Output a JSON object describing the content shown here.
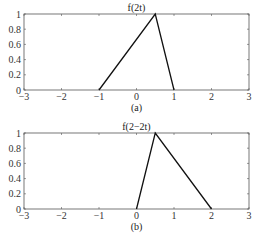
{
  "chart_data": [
    {
      "type": "line",
      "title": "f(2t)",
      "caption": "(a)",
      "xlabel": "",
      "ylabel": "",
      "xlim": [
        -3,
        3
      ],
      "ylim": [
        0,
        1
      ],
      "xticks": [
        "-3",
        "-2",
        "-1",
        "0",
        "1",
        "2",
        "3"
      ],
      "yticks": [
        "0",
        "0.2",
        "0.4",
        "0.6",
        "0.8",
        "1"
      ],
      "grid": false,
      "series": [
        {
          "name": "f(2t)",
          "x": [
            -1,
            0.5,
            1
          ],
          "y": [
            0,
            1,
            0
          ]
        }
      ]
    },
    {
      "type": "line",
      "title": "f(2−2t)",
      "caption": "(b)",
      "xlabel": "",
      "ylabel": "",
      "xlim": [
        -3,
        3
      ],
      "ylim": [
        0,
        1
      ],
      "xticks": [
        "-3",
        "-2",
        "-1",
        "0",
        "1",
        "2",
        "3"
      ],
      "yticks": [
        "0",
        "0.2",
        "0.4",
        "0.6",
        "0.8",
        "1"
      ],
      "grid": false,
      "series": [
        {
          "name": "f(2-2t)",
          "x": [
            0,
            0.5,
            2
          ],
          "y": [
            0,
            1,
            0
          ]
        }
      ]
    }
  ]
}
